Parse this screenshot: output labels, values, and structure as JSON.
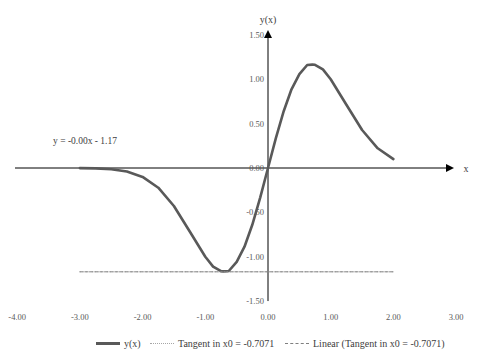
{
  "chart_data": {
    "type": "line",
    "title": "",
    "xlabel": "x",
    "ylabel": "y(x)",
    "xlim": [
      -4.0,
      3.0
    ],
    "ylim": [
      -1.5,
      1.5
    ],
    "x_ticks": [
      "-4.00",
      "-3.00",
      "-2.00",
      "-1.00",
      "0.00",
      "1.00",
      "2.00",
      "3.00"
    ],
    "y_ticks": [
      "1.50",
      "1.00",
      "0.50",
      "0.00",
      "-0.50",
      "-1.00",
      "-1.50"
    ],
    "x_tick_values": [
      -4,
      -3,
      -2,
      -1,
      0,
      1,
      2,
      3
    ],
    "y_tick_values": [
      1.5,
      1.0,
      0.5,
      0.0,
      -0.5,
      -1.0,
      -1.5
    ],
    "grid": false,
    "legend_position": "bottom",
    "annotation": "y = -0.00x - 1.17",
    "series": [
      {
        "name": "y(x)",
        "style": "solid",
        "color": "#595959",
        "x": [
          -3.0,
          -2.75,
          -2.5,
          -2.25,
          -2.0,
          -1.75,
          -1.5,
          -1.25,
          -1.0,
          -0.875,
          -0.75,
          -0.7071,
          -0.625,
          -0.5,
          -0.375,
          -0.25,
          -0.125,
          0.0,
          0.125,
          0.25,
          0.375,
          0.5,
          0.625,
          0.7071,
          0.75,
          0.875,
          1.0,
          1.25,
          1.5,
          1.75,
          2.0
        ],
        "y": [
          -0.001,
          -0.004,
          -0.013,
          -0.039,
          -0.1,
          -0.222,
          -0.428,
          -0.714,
          -1.0,
          -1.112,
          -1.163,
          -1.166,
          -1.161,
          -1.058,
          -0.887,
          -0.64,
          -0.334,
          0.0,
          0.334,
          0.64,
          0.887,
          1.058,
          1.161,
          1.166,
          1.163,
          1.112,
          1.0,
          0.714,
          0.428,
          0.222,
          0.1
        ]
      },
      {
        "name": "Tangent in x0 = -0.7071",
        "style": "dotted",
        "color": "#a6a6a6",
        "x": [
          -3.0,
          2.0
        ],
        "y": [
          -1.17,
          -1.17
        ]
      },
      {
        "name": "Linear (Tangent in x0 = -0.7071)",
        "style": "dashed",
        "color": "#7f7f7f",
        "x": [
          -3.0,
          2.0
        ],
        "y": [
          -1.17,
          -1.17
        ]
      }
    ]
  },
  "legend": {
    "items": [
      {
        "label": "y(x)",
        "style": "solid"
      },
      {
        "label": "Tangent in x0 = -0.7071",
        "style": "dot"
      },
      {
        "label": "Linear (Tangent in x0 = -0.7071)",
        "style": "dash"
      }
    ]
  }
}
